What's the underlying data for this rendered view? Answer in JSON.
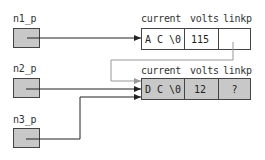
{
  "diagram": {
    "pointers": [
      {
        "label": "n1_p"
      },
      {
        "label": "n2_p"
      },
      {
        "label": "n3_p"
      }
    ],
    "nodes": [
      {
        "headers": {
          "current": "current",
          "volts": "volts",
          "linkp": "linkp"
        },
        "current": "A C \\0",
        "volts": "115",
        "linkp": "",
        "fill": "#ffffff"
      },
      {
        "headers": {
          "current": "current",
          "volts": "volts",
          "linkp": "linkp"
        },
        "current": "D C \\0",
        "volts": "12",
        "linkp": "?",
        "fill": "#c8c8c8"
      }
    ],
    "colors": {
      "pointer_fill": "#c8c8c8",
      "arrow": "#222222",
      "link_arrow": "#999999"
    }
  }
}
